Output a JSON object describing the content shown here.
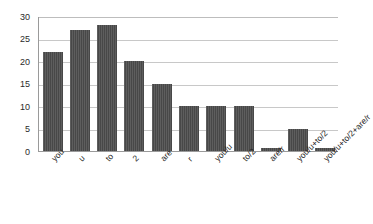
{
  "chart_data": {
    "type": "bar",
    "title": "",
    "subtitle": "",
    "xlabel": "",
    "ylabel": "",
    "categories": [
      "you",
      "u",
      "to",
      "2",
      "are",
      "r",
      "you/u",
      "to/2",
      "are/r",
      "you/u+to/2",
      "you/u+to/2+are/r"
    ],
    "values": [
      22,
      27,
      28,
      20,
      15,
      10,
      10,
      10,
      0.7,
      4.8,
      0.7
    ],
    "ylim": [
      0,
      30
    ],
    "yticks": [
      0,
      5,
      10,
      15,
      20,
      25,
      30
    ],
    "ytick_labels": [
      "0",
      "5",
      "10",
      "15",
      "20",
      "25",
      "30"
    ],
    "grid": true,
    "grid_axis": "y",
    "legend": false,
    "legend_position": "none",
    "bar_color": "#4c4c4c",
    "grid_color": "#c8c8c8",
    "axis_color": "#9a9a9a",
    "background_color": "#ffffff"
  }
}
